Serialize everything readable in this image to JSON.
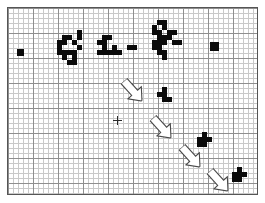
{
  "canvas": {
    "title": "Grid Occupancy Map",
    "width": 265,
    "height": 203,
    "frame": {
      "x": 7,
      "y": 7,
      "width": 251,
      "height": 188
    },
    "grid": {
      "minor_cell_px": 5,
      "major_every": 5,
      "minor_color": "#c9c9c9",
      "major_color": "#8f8f8f",
      "background_color": "#ffffff",
      "border_color": "#555555"
    },
    "cell_fill_color": "#0a0a0a",
    "arrow_stroke_color": "#4a4a4a",
    "arrow_fill_color": "#ffffff",
    "marker_color": "#2a2a2a"
  },
  "marker": {
    "name": "crosshair",
    "x": 116,
    "y": 119,
    "size": 9
  },
  "clusters": [
    {
      "id": "c1",
      "label": "left-isolated-block",
      "cells": [
        {
          "x": 16,
          "y": 48,
          "w": 7,
          "h": 7
        }
      ]
    },
    {
      "id": "c2",
      "label": "large-left-cluster",
      "cells": [
        {
          "x": 61,
          "y": 34,
          "w": 10,
          "h": 5
        },
        {
          "x": 71,
          "y": 39,
          "w": 5,
          "h": 5
        },
        {
          "x": 76,
          "y": 29,
          "w": 5,
          "h": 10
        },
        {
          "x": 56,
          "y": 39,
          "w": 10,
          "h": 5
        },
        {
          "x": 56,
          "y": 44,
          "w": 5,
          "h": 10
        },
        {
          "x": 61,
          "y": 49,
          "w": 15,
          "h": 5
        },
        {
          "x": 76,
          "y": 44,
          "w": 5,
          "h": 5
        },
        {
          "x": 61,
          "y": 54,
          "w": 5,
          "h": 5
        },
        {
          "x": 71,
          "y": 54,
          "w": 5,
          "h": 10
        },
        {
          "x": 66,
          "y": 59,
          "w": 5,
          "h": 5
        }
      ]
    },
    {
      "id": "c3",
      "label": "mid-left-cluster",
      "cells": [
        {
          "x": 101,
          "y": 34,
          "w": 10,
          "h": 5
        },
        {
          "x": 96,
          "y": 39,
          "w": 10,
          "h": 5
        },
        {
          "x": 101,
          "y": 44,
          "w": 5,
          "h": 10
        },
        {
          "x": 96,
          "y": 49,
          "w": 5,
          "h": 5
        },
        {
          "x": 106,
          "y": 49,
          "w": 10,
          "h": 5
        },
        {
          "x": 111,
          "y": 44,
          "w": 5,
          "h": 5
        },
        {
          "x": 116,
          "y": 49,
          "w": 5,
          "h": 5
        },
        {
          "x": 126,
          "y": 44,
          "w": 10,
          "h": 5
        }
      ]
    },
    {
      "id": "c4",
      "label": "right-wedge-cluster",
      "cells": [
        {
          "x": 156,
          "y": 19,
          "w": 10,
          "h": 5
        },
        {
          "x": 151,
          "y": 24,
          "w": 5,
          "h": 5
        },
        {
          "x": 161,
          "y": 24,
          "w": 5,
          "h": 5
        },
        {
          "x": 151,
          "y": 29,
          "w": 10,
          "h": 5
        },
        {
          "x": 166,
          "y": 29,
          "w": 10,
          "h": 5
        },
        {
          "x": 156,
          "y": 34,
          "w": 15,
          "h": 5
        },
        {
          "x": 171,
          "y": 39,
          "w": 10,
          "h": 5
        },
        {
          "x": 151,
          "y": 39,
          "w": 15,
          "h": 5
        },
        {
          "x": 151,
          "y": 44,
          "w": 10,
          "h": 5
        },
        {
          "x": 156,
          "y": 49,
          "w": 10,
          "h": 5
        },
        {
          "x": 161,
          "y": 54,
          "w": 5,
          "h": 5
        }
      ]
    },
    {
      "id": "c5",
      "label": "far-right-block",
      "cells": [
        {
          "x": 209,
          "y": 41,
          "w": 9,
          "h": 9
        }
      ]
    },
    {
      "id": "c6",
      "label": "upper-mid-small-cluster",
      "cells": [
        {
          "x": 161,
          "y": 86,
          "w": 5,
          "h": 5
        },
        {
          "x": 156,
          "y": 91,
          "w": 10,
          "h": 5
        },
        {
          "x": 166,
          "y": 96,
          "w": 5,
          "h": 5
        },
        {
          "x": 161,
          "y": 96,
          "w": 5,
          "h": 5
        }
      ]
    },
    {
      "id": "c7",
      "label": "mid-right-small-cluster",
      "cells": [
        {
          "x": 201,
          "y": 131,
          "w": 5,
          "h": 5
        },
        {
          "x": 196,
          "y": 136,
          "w": 10,
          "h": 5
        },
        {
          "x": 206,
          "y": 136,
          "w": 5,
          "h": 5
        },
        {
          "x": 196,
          "y": 141,
          "w": 5,
          "h": 5
        },
        {
          "x": 201,
          "y": 141,
          "w": 5,
          "h": 5
        }
      ]
    },
    {
      "id": "c8",
      "label": "bottom-right-small-cluster",
      "cells": [
        {
          "x": 236,
          "y": 166,
          "w": 5,
          "h": 5
        },
        {
          "x": 231,
          "y": 171,
          "w": 10,
          "h": 5
        },
        {
          "x": 241,
          "y": 171,
          "w": 5,
          "h": 5
        },
        {
          "x": 231,
          "y": 176,
          "w": 5,
          "h": 5
        },
        {
          "x": 236,
          "y": 176,
          "w": 5,
          "h": 5
        }
      ]
    }
  ],
  "arrows": [
    {
      "id": "a1",
      "label": "arrow-1",
      "x1": 123,
      "y1": 80,
      "x2": 141,
      "y2": 100
    },
    {
      "id": "a2",
      "label": "arrow-2",
      "x1": 152,
      "y1": 117,
      "x2": 170,
      "y2": 137
    },
    {
      "id": "a3",
      "label": "arrow-3",
      "x1": 181,
      "y1": 146,
      "x2": 199,
      "y2": 166
    },
    {
      "id": "a4",
      "label": "arrow-4",
      "x1": 209,
      "y1": 170,
      "x2": 227,
      "y2": 190
    }
  ]
}
